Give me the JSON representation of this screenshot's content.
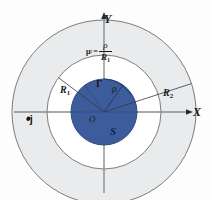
{
  "figure": {
    "background_color": "#fdfdfd",
    "center": {
      "x": 104,
      "y": 112,
      "origin_label": "O"
    },
    "axes": {
      "x_label": "X",
      "y_label": "Y",
      "axis_color": "#8c8c8c",
      "x_axis": {
        "from_x": 14,
        "to_x": 190,
        "y": 112
      },
      "y_axis": {
        "x": 104,
        "from_y": 190,
        "to_y": 14
      }
    },
    "regions": [
      {
        "name": "inner-disk",
        "label": "S",
        "radius_label": "R_1",
        "radius_px": 33,
        "fill": "#3d5c9c",
        "stroke": "#2a4073"
      },
      {
        "name": "middle-annulus",
        "label": "",
        "radius_label": "R_1",
        "radius_px": 57,
        "fill": "#ffffff",
        "stroke": "#6e6e6e"
      },
      {
        "name": "outer-annulus",
        "label": "",
        "radius_label": "R_2",
        "radius_px": 92,
        "fill": "#e9ebed",
        "stroke": "#6e6e6e"
      }
    ],
    "labels": {
      "y_axis": "Y",
      "x_axis": "X",
      "origin": "O",
      "inner_region": "S",
      "boundary_curve": "Γ",
      "radial_coordinate": "ρ",
      "inner_radius": "R",
      "inner_radius_sub": "1",
      "outer_radius": "R",
      "outer_radius_sub": "2",
      "current_point": "•j"
    },
    "formula": {
      "lhs": "μ",
      "lhs_sub": "r",
      "equals": "=",
      "numerator": "ρ",
      "denominator": "R",
      "denominator_sub": "1",
      "plain": "μ_r = ρ / R_1"
    },
    "radial_lines": [
      {
        "name": "rho-line",
        "label": "ρ",
        "angle_deg": 55,
        "length_px": 33
      },
      {
        "name": "r1-line",
        "label": "R_1",
        "angle_deg": 143,
        "length_px": 57
      },
      {
        "name": "r2-line",
        "label": "R_2",
        "angle_deg": 18,
        "length_px": 92
      }
    ],
    "colors": {
      "disk_blue": "#3d5c9c",
      "annulus_grey": "#e9ebed",
      "annulus_white": "#ffffff",
      "outline": "#6e6e6e",
      "axis": "#8c8c8c",
      "text": "#1a1a1a"
    }
  }
}
